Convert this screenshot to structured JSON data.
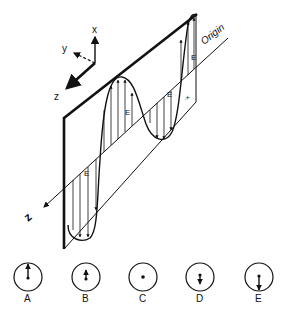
{
  "axes": {
    "x_label": "x",
    "y_label": "y",
    "z_label": "z"
  },
  "plane": {
    "origin_label": "Origin",
    "propagation_label": "z",
    "field_label": "E",
    "end_mark": "-x"
  },
  "field_labels": [
    "E",
    "E",
    "E",
    "E"
  ],
  "options": [
    {
      "label": "A",
      "arrow": "up-long"
    },
    {
      "label": "B",
      "arrow": "up-short"
    },
    {
      "label": "C",
      "arrow": "dot"
    },
    {
      "label": "D",
      "arrow": "down-short"
    },
    {
      "label": "E",
      "arrow": "down-long"
    }
  ],
  "colors": {
    "ink": "#111111",
    "background": "#ffffff"
  }
}
